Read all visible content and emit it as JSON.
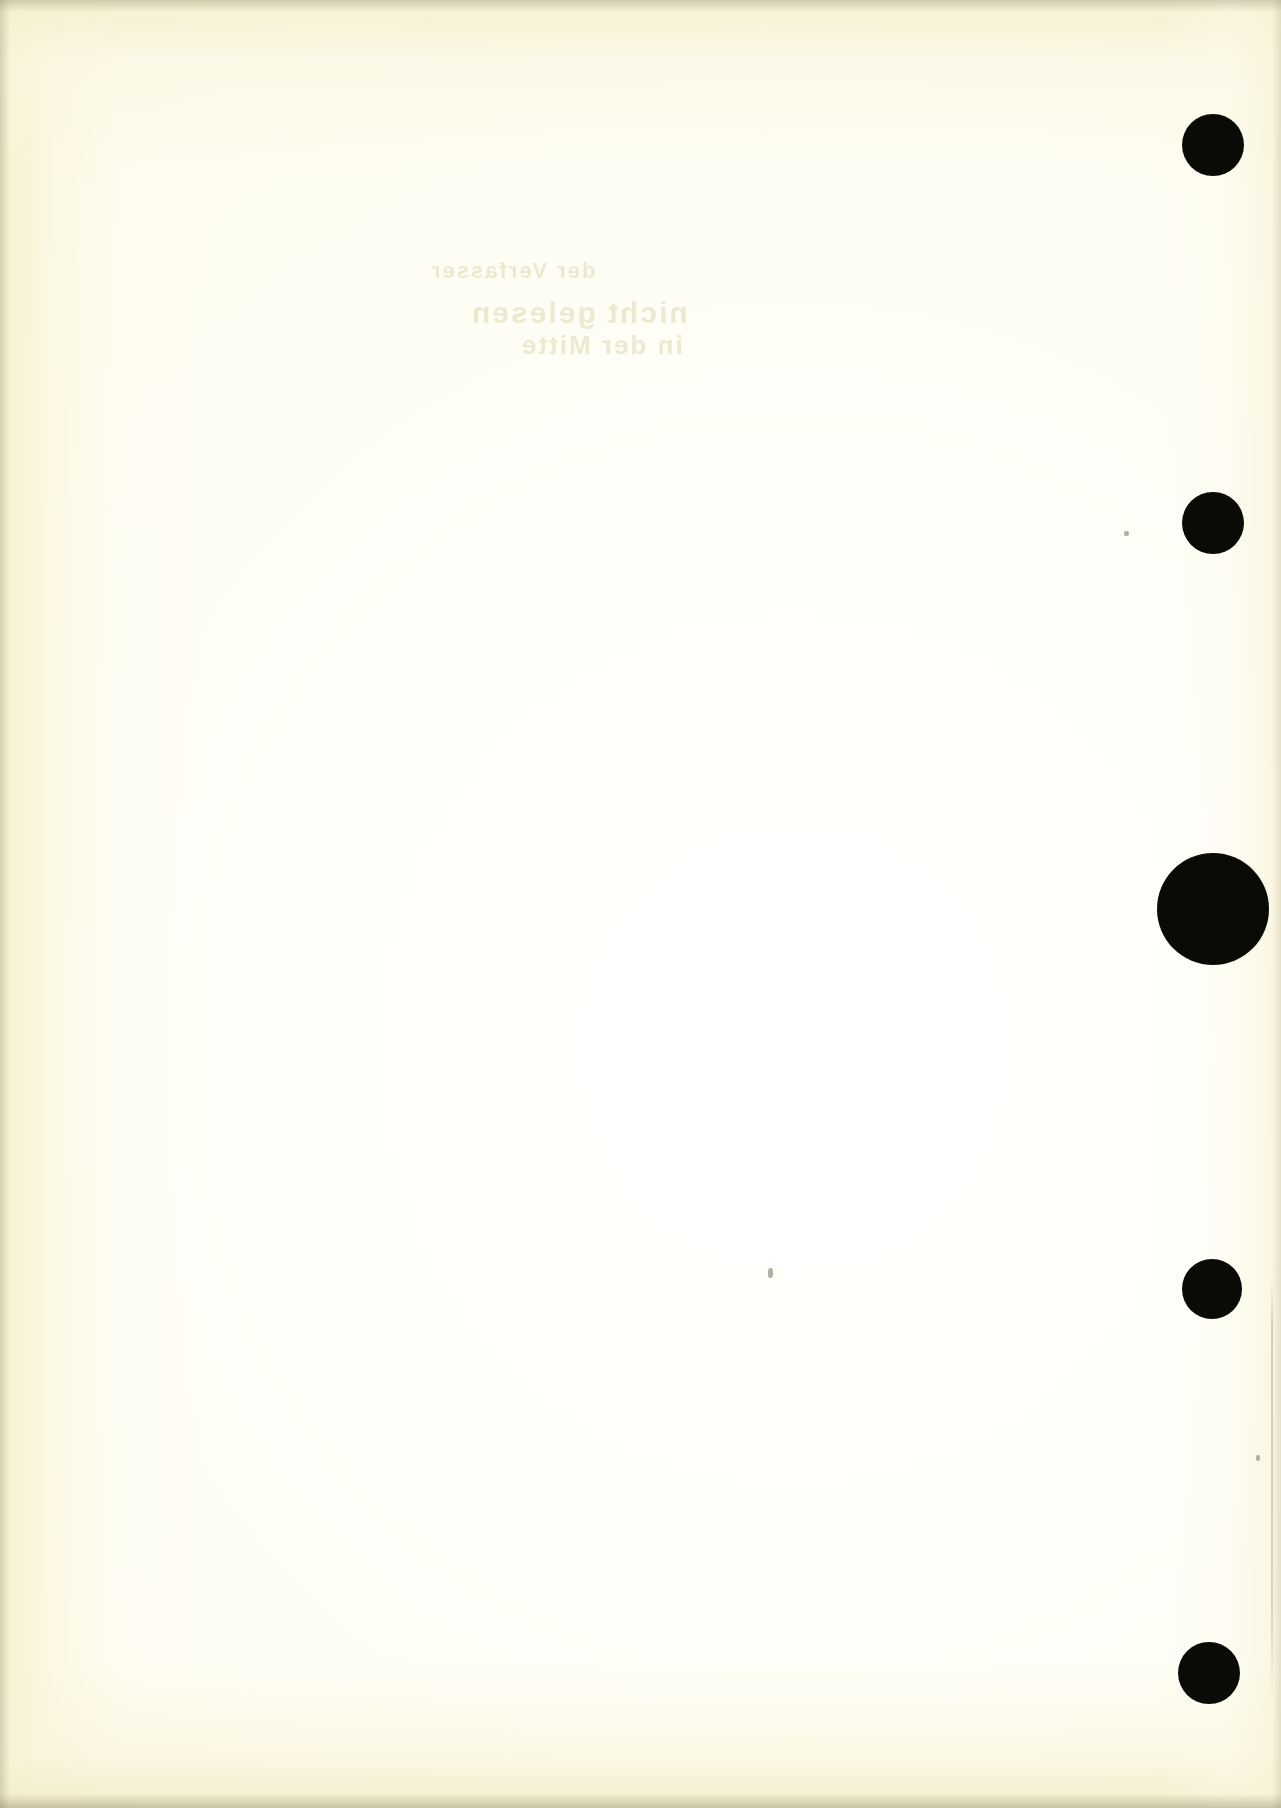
{
  "document": {
    "kind": "scanned-page",
    "description": "Blank scanned book page with black register dots along the right margin",
    "page_width": 1281,
    "page_height": 1808,
    "paper_color": "#fdfcf2",
    "ink_color": "#0a0a07",
    "visible_text": ""
  },
  "register_dots": [
    {
      "name": "register-dot-1",
      "cx": 1213,
      "cy": 145,
      "r": 31
    },
    {
      "name": "register-dot-2",
      "cx": 1213,
      "cy": 523,
      "r": 31
    },
    {
      "name": "register-dot-3",
      "cx": 1213,
      "cy": 909,
      "r": 56
    },
    {
      "name": "register-dot-4",
      "cx": 1212,
      "cy": 1289,
      "r": 30
    },
    {
      "name": "register-dot-5",
      "cx": 1209,
      "cy": 1673,
      "r": 31
    }
  ],
  "ghost_text": {
    "note": "Extremely faint mirrored show-through from the reverse side of the leaf",
    "lines": [
      {
        "text": "der Verfasser",
        "x": 430,
        "y": 258,
        "size": 22
      },
      {
        "text": "nicht gelesen",
        "x": 470,
        "y": 296,
        "size": 30
      },
      {
        "text": "in der Mitte",
        "x": 520,
        "y": 330,
        "size": 26
      }
    ]
  },
  "specks": [
    {
      "name": "speck-left-of-dot-2",
      "x": 1124,
      "y": 531,
      "w": 5,
      "h": 5
    },
    {
      "name": "speck-mid-page",
      "x": 768,
      "y": 1268,
      "w": 5,
      "h": 10
    },
    {
      "name": "speck-lower-right",
      "x": 1256,
      "y": 1455,
      "w": 4,
      "h": 6
    }
  ]
}
